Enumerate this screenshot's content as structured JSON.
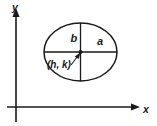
{
  "figure": {
    "type": "geometry-diagram",
    "background_color": "#ffffff",
    "stroke_color": "#1a1a1a"
  },
  "axes": {
    "x_label": "x",
    "y_label": "y",
    "origin": {
      "x": 16,
      "y": 107
    },
    "x_axis": {
      "start_x": 7,
      "end_x": 140,
      "y": 107,
      "arrow": "right"
    },
    "y_axis": {
      "x": 16,
      "start_y": 122,
      "end_y": 9,
      "arrow": "up"
    }
  },
  "ellipse": {
    "center": {
      "x": 80.5,
      "y": 52
    },
    "semi_major_px": 36.5,
    "semi_minor_px": 29,
    "semi_major_label": "a",
    "semi_minor_label": "b",
    "center_label": "(h, k)"
  },
  "labels": {
    "a": "a",
    "b": "b",
    "center": "(h, k)",
    "x": "x",
    "y": "y"
  }
}
